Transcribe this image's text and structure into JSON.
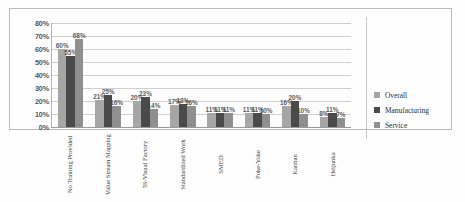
{
  "chart_data": {
    "type": "bar",
    "title": "",
    "xlabel": "",
    "ylabel": "",
    "ylim": [
      0,
      80
    ],
    "ytick_labels": [
      "80%",
      "70%",
      "60%",
      "50%",
      "40%",
      "30%",
      "20%",
      "10%",
      "0%"
    ],
    "ytick_values": [
      80,
      70,
      60,
      50,
      40,
      30,
      20,
      10,
      0
    ],
    "grid": true,
    "legend_position": "right",
    "categories": [
      "No Training Provided",
      "Value Stream Mapping",
      "5S/Visual Factory",
      "Standardized Work",
      "SMED",
      "Poke-Yoke",
      "Kanban",
      "Heijunka"
    ],
    "series": [
      {
        "name": "Overall",
        "color": "#a6a6a6",
        "values": [
          60,
          21,
          20,
          17,
          11,
          11,
          16,
          8
        ],
        "labels": [
          "60%",
          "21%",
          "20%",
          "17%",
          "11%",
          "11%",
          "16%",
          "8%"
        ]
      },
      {
        "name": "Manufacturing",
        "color": "#4a4a4a",
        "values": [
          55,
          25,
          23,
          18,
          11,
          11,
          20,
          11
        ],
        "labels": [
          "55%",
          "25%",
          "23%",
          "18%",
          "11%",
          "11%",
          "20%",
          "11%"
        ]
      },
      {
        "name": "Service",
        "color": "#8f8f8f",
        "values": [
          68,
          16,
          14,
          16,
          11,
          10,
          10,
          7
        ],
        "labels": [
          "68%",
          "16%",
          "14%",
          "16%",
          "11%",
          "10%",
          "10%",
          "7%"
        ]
      }
    ]
  }
}
